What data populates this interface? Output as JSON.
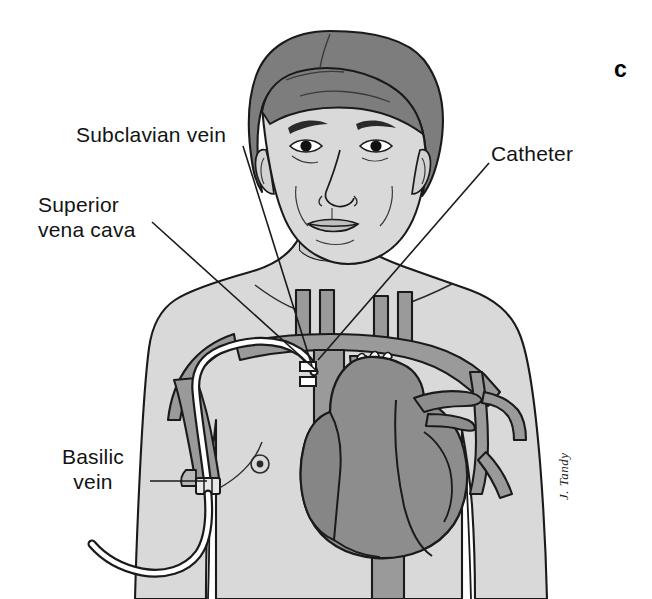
{
  "figure": {
    "panel_letter": "c",
    "signature": "J. Tandy"
  },
  "labels": {
    "subclavian_vein": "Subclavian vein",
    "superior_vena_cava_line1": "Superior",
    "superior_vena_cava_line2": "vena cava",
    "catheter": "Catheter",
    "basilic_vein_line1": "Basilic",
    "basilic_vein_line2": "vein"
  },
  "colors": {
    "background": "#ffffff",
    "skin": "#d9d9d9",
    "skin_shadow": "#c9c9c9",
    "hair": "#7d7d7d",
    "vessel": "#9a9a9a",
    "heart": "#8d8d8d",
    "heart_dark": "#868686",
    "outline": "#1a1a1a",
    "catheter_fill": "#ffffff",
    "leader_line": "#1a1a1a",
    "text": "#131313"
  },
  "anatomy_parts": [
    "head",
    "hair",
    "face",
    "neck",
    "torso",
    "left-shoulder",
    "right-shoulder",
    "subclavian-vein",
    "superior-vena-cava",
    "brachiocephalic-veins",
    "jugular-veins",
    "basilic-vein",
    "axillary-vein",
    "heart",
    "aorta",
    "pulmonary-artery",
    "inferior-vena-cava",
    "catheter-tube",
    "catheter-hub",
    "nipple-left",
    "nipple-right"
  ],
  "leader_lines": [
    {
      "name": "subclavian-vein-leader",
      "from": [
        243,
        146
      ],
      "to": [
        312,
        366
      ]
    },
    {
      "name": "superior-vena-cava-leader",
      "from": [
        152,
        222
      ],
      "to": [
        318,
        372
      ]
    },
    {
      "name": "catheter-leader",
      "from": [
        489,
        163
      ],
      "to": [
        318,
        360
      ]
    },
    {
      "name": "basilic-vein-leader",
      "from": [
        150,
        481
      ],
      "to": [
        207,
        481
      ]
    }
  ]
}
